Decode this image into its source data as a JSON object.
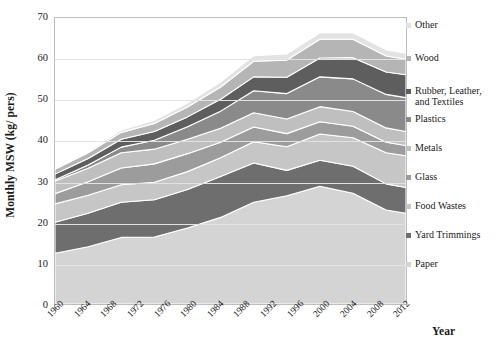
{
  "chart_data": {
    "type": "area",
    "title": "",
    "xlabel": "Year",
    "ylabel": "Monthly MSW (kg/ pers)",
    "ylim": [
      0,
      70
    ],
    "ytick_values": [
      0,
      10,
      20,
      30,
      40,
      50,
      60,
      70
    ],
    "xlim": [
      1960,
      2013
    ],
    "xtick_labels": [
      "1960",
      "1964",
      "1968",
      "1972",
      "1976",
      "1980",
      "1984",
      "1988",
      "1992",
      "1996",
      "2000",
      "2004",
      "2008",
      "2012"
    ],
    "xtick_values": [
      1960,
      1964,
      1968,
      1972,
      1976,
      1980,
      1984,
      1988,
      1992,
      1996,
      2000,
      2004,
      2008,
      2012
    ],
    "grid": true,
    "legend_position": "right",
    "stacked": true,
    "x": [
      1960,
      1965,
      1970,
      1975,
      1980,
      1985,
      1990,
      1995,
      2000,
      2005,
      2010,
      2013
    ],
    "series": [
      {
        "name": "Paper",
        "color": "#d4d4d4",
        "values": [
          12.4,
          14.0,
          16.3,
          16.4,
          18.6,
          21.2,
          24.9,
          26.5,
          28.8,
          27.1,
          23.0,
          22.2
        ]
      },
      {
        "name": "Yard Trimmings",
        "color": "#6e6e6e",
        "values": [
          7.6,
          8.2,
          8.6,
          9.1,
          9.4,
          10.0,
          9.6,
          6.2,
          6.4,
          6.6,
          6.4,
          6.3
        ]
      },
      {
        "name": "Food Wastes",
        "color": "#c6c6c6",
        "values": [
          4.5,
          4.4,
          4.3,
          4.3,
          4.4,
          4.6,
          5.2,
          5.8,
          6.4,
          7.0,
          7.6,
          7.8
        ]
      },
      {
        "name": "Glass",
        "color": "#9c9c9c",
        "values": [
          2.5,
          3.3,
          4.1,
          4.5,
          4.4,
          3.8,
          3.6,
          3.2,
          3.0,
          2.8,
          2.6,
          2.5
        ]
      },
      {
        "name": "Metals",
        "color": "#bfbfbf",
        "values": [
          3.1,
          3.3,
          3.7,
          3.6,
          3.5,
          3.4,
          3.5,
          3.6,
          3.7,
          3.6,
          3.5,
          3.4
        ]
      },
      {
        "name": "Plastics",
        "color": "#8a8a8a",
        "values": [
          0.3,
          0.8,
          1.4,
          2.2,
          3.1,
          4.2,
          5.4,
          6.2,
          7.3,
          8.0,
          8.2,
          8.3
        ]
      },
      {
        "name": "Rubber, Leather,\nand Textiles",
        "color": "#5e5e5e",
        "values": [
          1.4,
          1.6,
          1.9,
          2.1,
          2.4,
          2.9,
          3.4,
          4.0,
          4.6,
          5.2,
          5.5,
          5.6
        ]
      },
      {
        "name": "Wood",
        "color": "#b5b5b5",
        "values": [
          1.2,
          1.4,
          1.7,
          2.0,
          2.4,
          3.0,
          3.8,
          4.2,
          4.6,
          4.5,
          3.9,
          3.8
        ]
      },
      {
        "name": "Other",
        "color": "#e3e3e3",
        "values": [
          0.3,
          0.4,
          0.6,
          0.8,
          1.0,
          1.2,
          1.4,
          1.5,
          1.6,
          1.6,
          1.5,
          1.5
        ]
      }
    ]
  },
  "legend": {
    "items": [
      {
        "label": "Other"
      },
      {
        "label": "Wood"
      },
      {
        "label": "Rubber, Leather,\nand Textiles"
      },
      {
        "label": "Plastics"
      },
      {
        "label": "Metals"
      },
      {
        "label": "Glass"
      },
      {
        "label": "Food Wastes"
      },
      {
        "label": "Yard Trimmings"
      },
      {
        "label": "Paper"
      }
    ]
  },
  "axes": {
    "y_title": "Monthly MSW (kg/ pers)",
    "x_title": "Year"
  }
}
